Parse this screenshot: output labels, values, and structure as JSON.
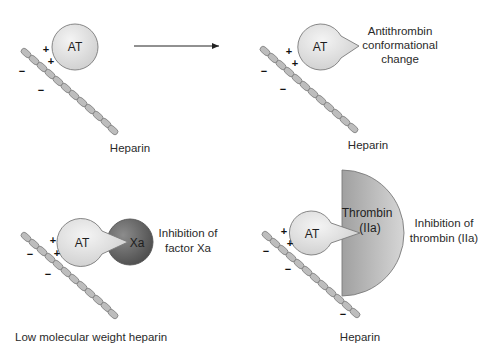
{
  "panels": {
    "binding": {
      "molecule_label": "AT",
      "positive_charges": [
        "+",
        "+"
      ],
      "negative_charges": [
        "−",
        "−"
      ],
      "chain_label": "Heparin"
    },
    "conformational_change": {
      "molecule_label": "AT",
      "positive_charges": [
        "+",
        "+"
      ],
      "negative_charges": [
        "−",
        "−"
      ],
      "annotation_lines": [
        "Antithrombin",
        "conformational",
        "change"
      ],
      "chain_label": "Heparin"
    },
    "factor_xa": {
      "molecule_label": "AT",
      "target_label": "Xa",
      "positive_charges": [
        "+",
        "+"
      ],
      "negative_charges": [
        "−",
        "−"
      ],
      "annotation_lines": [
        "Inhibition of",
        "factor Xa"
      ],
      "chain_label": "Low molecular weight heparin"
    },
    "thrombin": {
      "molecule_label": "AT",
      "target_label_lines": [
        "Thrombin",
        "(IIa)"
      ],
      "positive_charges": [
        "+",
        "+"
      ],
      "negative_charges": [
        "−",
        "−",
        "−"
      ],
      "annotation_lines": [
        "Inhibition of",
        "thrombin (IIa)"
      ],
      "chain_label": "Heparin"
    }
  },
  "colors": {
    "at_fill": "#e6e6e6",
    "xa_fill": "#6e6e6e",
    "thrombin_fill": "#b4b4b4",
    "chain_bead": "#bdbdbd",
    "outline": "#7a7a7a",
    "arrow": "#222222"
  }
}
